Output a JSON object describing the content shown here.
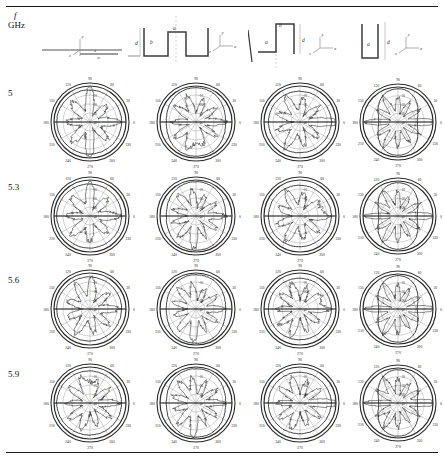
{
  "figure": {
    "header": {
      "freq_symbol": "f",
      "freq_unit": "GHz"
    },
    "geometries": [
      {
        "name": "flat-strip",
        "labels": [
          "y",
          "z",
          "x",
          "w"
        ]
      },
      {
        "name": "double-trough-corrugation",
        "labels": [
          "a",
          "b",
          "d",
          "y",
          "z",
          "x"
        ]
      },
      {
        "name": "single-step-corrugation",
        "labels": [
          "b",
          "a",
          "d",
          "y",
          "z",
          "x"
        ]
      },
      {
        "name": "narrow-slot-corrugation",
        "labels": [
          "a",
          "d",
          "y",
          "z",
          "x"
        ]
      }
    ],
    "row_labels": [
      "5",
      "5.3",
      "5.6",
      "5.9"
    ]
  },
  "chart_data": {
    "type": "line",
    "title": "",
    "subtitle": "Measured radiation patterns versus frequency for four corrugated-strip geometries",
    "plot_kind": "polar-radiation-pattern",
    "angle_unit": "degrees",
    "angle_ticks": [
      0,
      30,
      60,
      90,
      120,
      150,
      180,
      210,
      240,
      270,
      300,
      330
    ],
    "angle_tick_labels": [
      "0",
      "30",
      "60",
      "90",
      "120",
      "150",
      "180",
      "210",
      "240",
      "270",
      "300",
      "330"
    ],
    "radial_ticks": [
      -40,
      -30,
      -20,
      -10,
      0
    ],
    "radial_tick_labels": [
      "-40",
      "-30",
      "-20",
      "-10",
      "0"
    ],
    "radial_unit": "dB",
    "rlim": [
      -40,
      0
    ],
    "grid": true,
    "legend_position": "none",
    "rows": [
      {
        "frequency": "5",
        "unit": "GHz"
      },
      {
        "frequency": "5.3",
        "unit": "GHz"
      },
      {
        "frequency": "5.6",
        "unit": "GHz"
      },
      {
        "frequency": "5.9",
        "unit": "GHz"
      }
    ],
    "columns": [
      {
        "geometry": "flat-strip"
      },
      {
        "geometry": "double-trough-corrugation"
      },
      {
        "geometry": "single-step-corrugation"
      },
      {
        "geometry": "narrow-slot-corrugation"
      }
    ],
    "series": [
      {
        "name": "co-polar",
        "style": "solid-smooth"
      },
      {
        "name": "cross-polar",
        "style": "solid-ripple"
      }
    ],
    "panels": [
      {
        "row": 0,
        "col": 0,
        "shape": "near-circular-lobed",
        "outer_dB": -2,
        "ripple_lobes": 8,
        "notch_deg": [
          90,
          270
        ]
      },
      {
        "row": 0,
        "col": 1,
        "shape": "broad-two-lobe",
        "outer_dB": -1,
        "ripple_lobes": 10,
        "notch_deg": [
          90
        ]
      },
      {
        "row": 0,
        "col": 2,
        "shape": "asymmetric-lobed",
        "outer_dB": -2,
        "ripple_lobes": 9,
        "notch_deg": [
          180
        ]
      },
      {
        "row": 0,
        "col": 3,
        "shape": "figure-eight",
        "outer_dB": -1,
        "ripple_lobes": 12,
        "notch_deg": [
          0,
          180
        ]
      },
      {
        "row": 1,
        "col": 0,
        "shape": "near-circular-lobed",
        "outer_dB": -2,
        "ripple_lobes": 8,
        "notch_deg": [
          270
        ]
      },
      {
        "row": 1,
        "col": 1,
        "shape": "broad-two-lobe",
        "outer_dB": -1,
        "ripple_lobes": 11,
        "notch_deg": [
          90
        ]
      },
      {
        "row": 1,
        "col": 2,
        "shape": "asymmetric-lobed",
        "outer_dB": -2,
        "ripple_lobes": 9,
        "notch_deg": [
          200
        ]
      },
      {
        "row": 1,
        "col": 3,
        "shape": "figure-eight",
        "outer_dB": -1,
        "ripple_lobes": 12,
        "notch_deg": [
          0,
          180
        ]
      },
      {
        "row": 2,
        "col": 0,
        "shape": "near-circular-lobed",
        "outer_dB": -2,
        "ripple_lobes": 9,
        "notch_deg": [
          270
        ]
      },
      {
        "row": 2,
        "col": 1,
        "shape": "broad-two-lobe",
        "outer_dB": -1,
        "ripple_lobes": 11,
        "notch_deg": [
          90
        ]
      },
      {
        "row": 2,
        "col": 2,
        "shape": "asymmetric-lobed",
        "outer_dB": -2,
        "ripple_lobes": 10,
        "notch_deg": [
          200
        ]
      },
      {
        "row": 2,
        "col": 3,
        "shape": "figure-eight",
        "outer_dB": -1,
        "ripple_lobes": 12,
        "notch_deg": [
          0,
          180
        ]
      },
      {
        "row": 3,
        "col": 0,
        "shape": "near-circular-lobed",
        "outer_dB": -2,
        "ripple_lobes": 10,
        "notch_deg": [
          270
        ]
      },
      {
        "row": 3,
        "col": 1,
        "shape": "broad-two-lobe",
        "outer_dB": -1,
        "ripple_lobes": 11,
        "notch_deg": [
          90
        ]
      },
      {
        "row": 3,
        "col": 2,
        "shape": "asymmetric-lobed",
        "outer_dB": -2,
        "ripple_lobes": 10,
        "notch_deg": [
          180
        ]
      },
      {
        "row": 3,
        "col": 3,
        "shape": "figure-eight",
        "outer_dB": -1,
        "ripple_lobes": 12,
        "notch_deg": [
          0,
          180
        ]
      }
    ]
  }
}
